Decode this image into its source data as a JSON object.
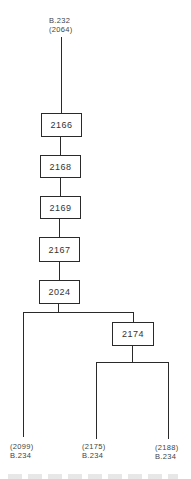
{
  "diagram": {
    "type": "stemma",
    "root": {
      "line1": "B.232",
      "line2": "(2064)"
    },
    "chain": [
      "2166",
      "2168",
      "2169",
      "2167",
      "2024"
    ],
    "branch_node": "2174",
    "leaves": [
      {
        "line1": "(2099)",
        "line2": "B.234"
      },
      {
        "line1": "(2175)",
        "line2": "B.234"
      },
      {
        "line1": "(2188)",
        "line2": "B.234"
      }
    ],
    "edges": [
      [
        "B.232 (2064)",
        "2166"
      ],
      [
        "2166",
        "2168"
      ],
      [
        "2168",
        "2169"
      ],
      [
        "2169",
        "2167"
      ],
      [
        "2167",
        "2024"
      ],
      [
        "2024",
        "(2099) B.234"
      ],
      [
        "2024",
        "2174"
      ],
      [
        "2174",
        "(2175) B.234"
      ],
      [
        "2174",
        "(2188) B.234"
      ]
    ]
  }
}
